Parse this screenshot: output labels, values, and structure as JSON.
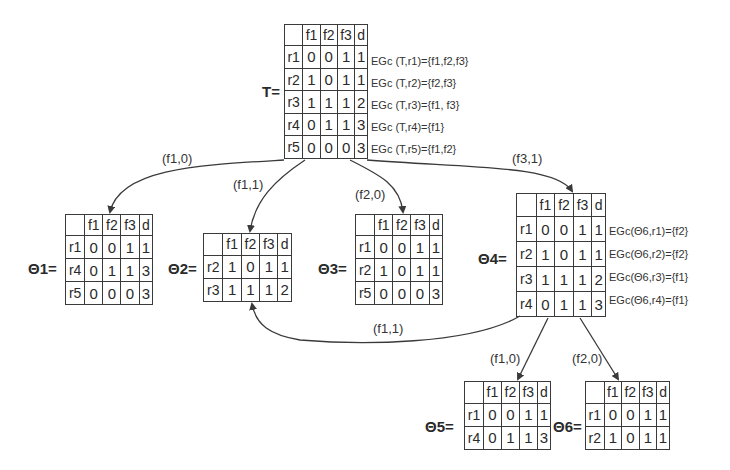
{
  "diagram": {
    "type": "decision-tree",
    "tables": {
      "T": {
        "label": "T=",
        "headers": [
          "",
          "f1",
          "f2",
          "f3",
          "d"
        ],
        "rows": [
          {
            "id": "r1",
            "values": [
              "0",
              "0",
              "1",
              "1"
            ],
            "annotation": "EGc (T,r1)={f1,f2,f3}"
          },
          {
            "id": "r2",
            "values": [
              "1",
              "0",
              "1",
              "1"
            ],
            "annotation": "EGc (T,r2)={f2,f3}"
          },
          {
            "id": "r3",
            "values": [
              "1",
              "1",
              "1",
              "2"
            ],
            "annotation": "EGc (T,r3)={f1, f3}"
          },
          {
            "id": "r4",
            "values": [
              "0",
              "1",
              "1",
              "3"
            ],
            "annotation": "EGc (T,r4)={f1}"
          },
          {
            "id": "r5",
            "values": [
              "0",
              "0",
              "0",
              "3"
            ],
            "annotation": "EGc (T,r5)={f1,f2}"
          }
        ]
      },
      "theta1": {
        "label": "Θ1=",
        "headers": [
          "",
          "f1",
          "f2",
          "f3",
          "d"
        ],
        "rows": [
          {
            "id": "r1",
            "values": [
              "0",
              "0",
              "1",
              "1"
            ]
          },
          {
            "id": "r4",
            "values": [
              "0",
              "1",
              "1",
              "3"
            ]
          },
          {
            "id": "r5",
            "values": [
              "0",
              "0",
              "0",
              "3"
            ]
          }
        ]
      },
      "theta2": {
        "label": "Θ2=",
        "headers": [
          "",
          "f1",
          "f2",
          "f3",
          "d"
        ],
        "rows": [
          {
            "id": "r2",
            "values": [
              "1",
              "0",
              "1",
              "1"
            ]
          },
          {
            "id": "r3",
            "values": [
              "1",
              "1",
              "1",
              "2"
            ]
          }
        ]
      },
      "theta3": {
        "label": "Θ3=",
        "headers": [
          "",
          "f1",
          "f2",
          "f3",
          "d"
        ],
        "rows": [
          {
            "id": "r1",
            "values": [
              "0",
              "0",
              "1",
              "1"
            ]
          },
          {
            "id": "r2",
            "values": [
              "1",
              "0",
              "1",
              "1"
            ]
          },
          {
            "id": "r5",
            "values": [
              "0",
              "0",
              "0",
              "3"
            ]
          }
        ]
      },
      "theta4": {
        "label": "Θ4=",
        "headers": [
          "",
          "f1",
          "f2",
          "f3",
          "d"
        ],
        "rows": [
          {
            "id": "r1",
            "values": [
              "0",
              "0",
              "1",
              "1"
            ],
            "annotation": "EGc(Θ6,r1)={f2}"
          },
          {
            "id": "r2",
            "values": [
              "1",
              "0",
              "1",
              "1"
            ],
            "annotation": "EGc(Θ6,r2)={f2}"
          },
          {
            "id": "r3",
            "values": [
              "1",
              "1",
              "1",
              "2"
            ],
            "annotation": "EGc(Θ6,r3)={f1}"
          },
          {
            "id": "r4",
            "values": [
              "0",
              "1",
              "1",
              "3"
            ],
            "annotation": "EGc(Θ6,r4)={f1}"
          }
        ]
      },
      "theta5": {
        "label": "Θ5=",
        "headers": [
          "",
          "f1",
          "f2",
          "f3",
          "d"
        ],
        "rows": [
          {
            "id": "r1",
            "values": [
              "0",
              "0",
              "1",
              "1"
            ]
          },
          {
            "id": "r4",
            "values": [
              "0",
              "1",
              "1",
              "3"
            ]
          }
        ]
      },
      "theta6": {
        "label": "Θ6=",
        "headers": [
          "",
          "f1",
          "f2",
          "f3",
          "d"
        ],
        "rows": [
          {
            "id": "r1",
            "values": [
              "0",
              "0",
              "1",
              "1"
            ]
          },
          {
            "id": "r2",
            "values": [
              "1",
              "0",
              "1",
              "1"
            ]
          }
        ]
      }
    },
    "edges": [
      {
        "from": "T",
        "to": "theta1",
        "label": "(f1,0)"
      },
      {
        "from": "T",
        "to": "theta2",
        "label": "(f1,1)"
      },
      {
        "from": "T",
        "to": "theta3",
        "label": "(f2,0)"
      },
      {
        "from": "T",
        "to": "theta4",
        "label": "(f3,1)"
      },
      {
        "from": "theta4",
        "to": "theta2",
        "label": "(f1,1)"
      },
      {
        "from": "theta4",
        "to": "theta5",
        "label": "(f1,0)"
      },
      {
        "from": "theta4",
        "to": "theta6",
        "label": "(f2,0)"
      }
    ],
    "line_color": "#3a3a3a"
  }
}
